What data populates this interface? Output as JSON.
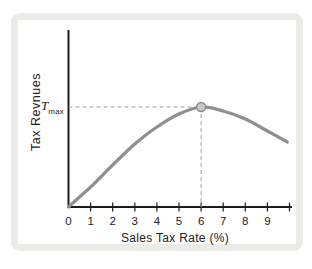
{
  "labels": {
    "y_axis": "Tax Revnues",
    "x_axis": "Sales Tax Rate (%)",
    "t_max_base": "T",
    "t_max_sub": "max"
  },
  "colors": {
    "background": "#ffffff",
    "frame": "#ebebe7",
    "axis": "#1c1c1c",
    "curve": "#8f8f8f",
    "dashed_guide": "#a0a0a0",
    "marker_fill": "#c7c7c7",
    "marker_stroke": "#8a8a8a",
    "text": "#222222"
  },
  "chart_data": {
    "type": "line",
    "title": "",
    "xlabel": "Sales Tax Rate (%)",
    "ylabel": "Tax Revnues",
    "x": [
      0,
      0.5,
      1,
      1.5,
      2,
      3,
      4,
      5,
      6,
      7,
      8,
      9,
      9.9
    ],
    "y": [
      0,
      0.1,
      0.2,
      0.31,
      0.42,
      0.63,
      0.8,
      0.93,
      1.0,
      0.96,
      0.88,
      0.76,
      0.65
    ],
    "y_units": "fraction of T_max (axis unlabeled numerically)",
    "xlim": [
      0,
      10.1
    ],
    "ylim": [
      0,
      1.77
    ],
    "x_tick_labels": [
      0,
      1,
      2,
      3,
      4,
      5,
      6,
      7,
      8,
      9
    ],
    "x_tick_marks": [
      1,
      2,
      3,
      4,
      5,
      6,
      7,
      8,
      9,
      10
    ],
    "peak": {
      "x": 6,
      "y": 1.0,
      "label": "Tmax",
      "marker": "circle"
    },
    "guides": [
      {
        "type": "dashed-horizontal",
        "from_x": 0,
        "to_x": 6,
        "at_y": 1.0
      },
      {
        "type": "dashed-vertical",
        "at_x": 6,
        "from_y": 0,
        "to_y": 1.0
      }
    ],
    "grid": false,
    "legend": false
  }
}
